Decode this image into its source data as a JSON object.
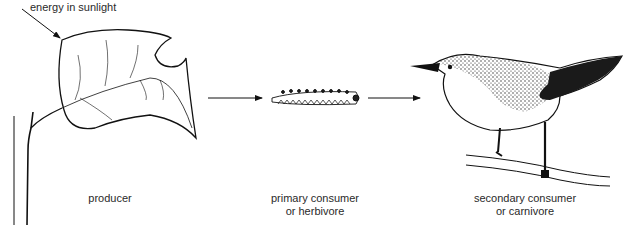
{
  "diagram": {
    "energy_label": "energy in sunlight",
    "stages": [
      {
        "name": "producer",
        "label_line1": "producer",
        "label_line2": ""
      },
      {
        "name": "primary-consumer",
        "label_line1": "primary consumer",
        "label_line2": "or herbivore"
      },
      {
        "name": "secondary-consumer",
        "label_line1": "secondary consumer",
        "label_line2": "or carnivore"
      }
    ]
  }
}
